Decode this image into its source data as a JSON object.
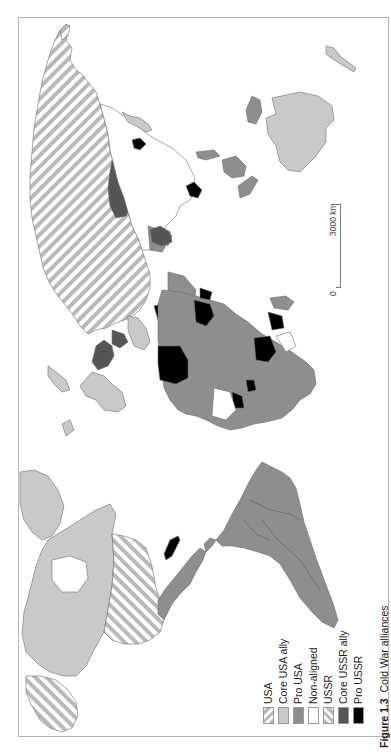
{
  "figure": {
    "caption_number": "Figure 1.3",
    "caption_title": "Cold War alliances",
    "orientation": "rotated 90° counter-clockwise"
  },
  "legend": {
    "items": [
      {
        "label": "USA",
        "fill": "hatch-forward",
        "color": "#b9b9b9"
      },
      {
        "label": "Core USA ally",
        "fill": "solid",
        "color": "#c9c9c9"
      },
      {
        "label": "Pro USA",
        "fill": "solid",
        "color": "#8e8e8e"
      },
      {
        "label": "Non-aligned",
        "fill": "solid",
        "color": "#ffffff"
      },
      {
        "label": "USSR",
        "fill": "hatch-back",
        "color": "#b9b9b9"
      },
      {
        "label": "Core USSR ally",
        "fill": "solid",
        "color": "#555555"
      },
      {
        "label": "Pro USSR",
        "fill": "solid",
        "color": "#000000"
      }
    ]
  },
  "scale_bar": {
    "start_label": "0",
    "end_label": "3000 km"
  },
  "colors": {
    "border": "#6e6e6e",
    "frame": "#b4b4b4",
    "hatch_stripe": "#b9b9b9",
    "core_usa_ally": "#c9c9c9",
    "pro_usa": "#8e8e8e",
    "non_aligned": "#ffffff",
    "core_ussr_ally": "#555555",
    "pro_ussr": "#000000"
  },
  "regions": [
    {
      "name": "USSR",
      "category": "USSR"
    },
    {
      "name": "USA (contiguous)",
      "category": "USA"
    },
    {
      "name": "Alaska",
      "category": "USA"
    },
    {
      "name": "Canada",
      "category": "Core USA ally"
    },
    {
      "name": "Greenland",
      "category": "Core USA ally"
    },
    {
      "name": "Western Europe",
      "category": "Core USA ally"
    },
    {
      "name": "Australia",
      "category": "Core USA ally"
    },
    {
      "name": "Japan",
      "category": "Core USA ally"
    },
    {
      "name": "Mexico / Central America",
      "category": "Pro USA"
    },
    {
      "name": "South America",
      "category": "Pro USA"
    },
    {
      "name": "Africa (most)",
      "category": "Pro USA"
    },
    {
      "name": "Middle East (part)",
      "category": "Pro USA"
    },
    {
      "name": "Southeast Asia (part)",
      "category": "Pro USA"
    },
    {
      "name": "Cuba",
      "category": "Pro USSR"
    },
    {
      "name": "Eastern Europe",
      "category": "Core USSR ally"
    },
    {
      "name": "Mongolia",
      "category": "Core USSR ally"
    },
    {
      "name": "Libya / Algeria / Angola / Ethiopia etc.",
      "category": "Pro USSR"
    },
    {
      "name": "China / India / others",
      "category": "Non-aligned"
    }
  ]
}
